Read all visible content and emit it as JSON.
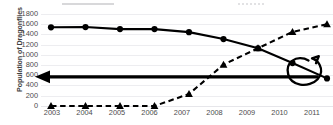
{
  "chart_data": {
    "type": "line",
    "title": "",
    "xlabel": "",
    "ylabel": "Population of Dragonflies",
    "categories": [
      "2003",
      "2004",
      "2005",
      "2006",
      "2007",
      "2008",
      "2009",
      "2010",
      "2011"
    ],
    "ylim": [
      0,
      1800
    ],
    "ytick_labels": [
      "1800",
      "1600",
      "1400",
      "1200",
      "1000",
      "800",
      "600",
      "400",
      "200",
      "0"
    ],
    "ytick_values": [
      1800,
      1600,
      1400,
      1200,
      1000,
      800,
      600,
      400,
      200,
      0
    ],
    "grid": true,
    "legend_position": "top",
    "series": [
      {
        "name": "declining-series",
        "marker": "circle",
        "line_style": "solid",
        "color": "#000000",
        "values": [
          1540,
          1545,
          1505,
          1505,
          1445,
          1310,
          1130,
          840,
          540
        ]
      },
      {
        "name": "rising-series",
        "marker": "triangle",
        "line_style": "dashed",
        "color": "#000000",
        "values": [
          0,
          0,
          0,
          0,
          235,
          810,
          1130,
          1450,
          1600
        ]
      }
    ],
    "annotations": [
      {
        "name": "horizontal-left-arrow",
        "type": "arrow",
        "direction": "left",
        "y_value": 570,
        "x_from": "2011",
        "x_to": "2003"
      },
      {
        "name": "hand-drawn-circle",
        "type": "freehand-ellipse",
        "encircles_point": {
          "series": "declining-series",
          "category": "2011",
          "value": 540
        }
      }
    ]
  },
  "legend": {
    "item_solid_label": "",
    "item_dash_label": ""
  }
}
